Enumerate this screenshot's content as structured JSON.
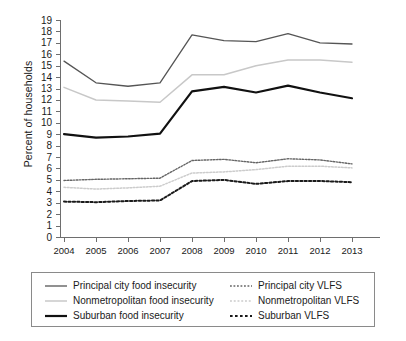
{
  "chart_data": {
    "type": "line",
    "title": "",
    "xlabel": "",
    "ylabel": "Percent of households",
    "categories": [
      "2004",
      "2005",
      "2006",
      "2007",
      "2008",
      "2009",
      "2010",
      "2011",
      "2012",
      "2013"
    ],
    "x": [
      2004,
      2005,
      2006,
      2007,
      2008,
      2009,
      2010,
      2011,
      2012,
      2013
    ],
    "ylim": [
      0,
      19
    ],
    "xlim": [
      2004,
      2013
    ],
    "ytick_labels": [
      "0",
      "1",
      "2",
      "3",
      "4",
      "5",
      "6",
      "7",
      "8",
      "9",
      "10",
      "11",
      "12",
      "13",
      "14",
      "15",
      "16",
      "17",
      "18",
      "19"
    ],
    "ytick_values": [
      0,
      1,
      2,
      3,
      4,
      5,
      6,
      7,
      8,
      9,
      10,
      11,
      12,
      13,
      14,
      15,
      16,
      17,
      18,
      19
    ],
    "xtick_labels": [
      "2004",
      "2005",
      "2006",
      "2007",
      "2008",
      "2009",
      "2010",
      "2011",
      "2012",
      "2013"
    ],
    "grid": false,
    "legend_position": "below-plot",
    "series": [
      {
        "name": "Principal city food insecurity",
        "style": "solid",
        "color": "#555555",
        "width": 1.3,
        "values": [
          15.4,
          13.5,
          13.2,
          13.5,
          17.7,
          17.2,
          17.1,
          17.8,
          17.0,
          16.9
        ]
      },
      {
        "name": "Nonmetropolitan food insecurity",
        "style": "solid",
        "color": "#c8c8c8",
        "width": 1.5,
        "values": [
          13.1,
          12.0,
          11.9,
          11.8,
          14.2,
          14.2,
          15.0,
          15.5,
          15.5,
          15.3
        ]
      },
      {
        "name": "Suburban food insecurity",
        "style": "solid",
        "color": "#111111",
        "width": 2.2,
        "values": [
          9.0,
          8.7,
          8.8,
          9.05,
          12.75,
          13.15,
          12.65,
          13.25,
          12.65,
          12.15
        ]
      },
      {
        "name": "Principal city VLFS",
        "style": "dotted",
        "color": "#666666",
        "width": 1.4,
        "values": [
          4.95,
          5.05,
          5.1,
          5.15,
          6.7,
          6.8,
          6.5,
          6.85,
          6.75,
          6.4
        ]
      },
      {
        "name": "Nonmetropolitan VLFS",
        "style": "dotted",
        "color": "#cccccc",
        "width": 1.5,
        "values": [
          4.35,
          4.2,
          4.3,
          4.45,
          5.6,
          5.7,
          5.9,
          6.2,
          6.2,
          6.05
        ]
      },
      {
        "name": "Suburban VLFS",
        "style": "dotted",
        "color": "#1a1a1a",
        "width": 2.0,
        "values": [
          3.1,
          3.05,
          3.15,
          3.2,
          4.9,
          5.0,
          4.65,
          4.9,
          4.9,
          4.8
        ]
      }
    ]
  },
  "axis": {
    "y_title": "Percent of households"
  },
  "legend": {
    "left_column": [
      {
        "label": "Principal city food insecurity",
        "style": "solid",
        "color": "#555555",
        "width": 1.3
      },
      {
        "label": "Nonmetropolitan food insecurity",
        "style": "solid",
        "color": "#c8c8c8",
        "width": 1.5
      },
      {
        "label": "Suburban food insecurity",
        "style": "solid",
        "color": "#111111",
        "width": 2.2
      }
    ],
    "right_column": [
      {
        "label": "Principal city VLFS",
        "style": "dotted",
        "color": "#666666",
        "width": 1.4
      },
      {
        "label": "Nonmetropolitan VLFS",
        "style": "dotted",
        "color": "#cccccc",
        "width": 1.5
      },
      {
        "label": "Suburban VLFS",
        "style": "dotted",
        "color": "#1a1a1a",
        "width": 2.0
      }
    ]
  }
}
